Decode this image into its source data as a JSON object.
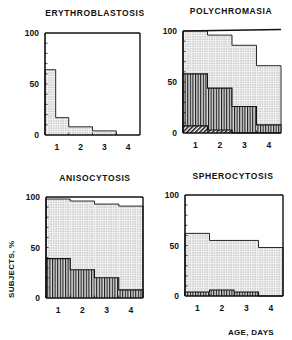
{
  "figure": {
    "ylabel": "SUBJECTS, %",
    "xlabel": "AGE, DAYS"
  },
  "colors": {
    "ink": "#111111",
    "dots": "#9a9a9a",
    "background": "#ffffff"
  },
  "chart_data": [
    {
      "type": "bar",
      "title": "ERYTHROBLASTOSIS",
      "xlabel": "",
      "ylabel": "",
      "categories": [
        "1",
        "2",
        "3",
        "4"
      ],
      "yticks": [
        "0",
        "50",
        "100"
      ],
      "ylim": [
        0,
        100
      ],
      "bar_edges": [
        0,
        0.45,
        1.0,
        2.0,
        3.0
      ],
      "series": [
        {
          "name": "dotted",
          "pattern": "dots",
          "values": [
            64,
            17,
            8,
            4
          ]
        }
      ],
      "layout": {
        "x": 45,
        "y": 33,
        "w": 95,
        "h": 102,
        "tickx": 9,
        "titlex": 95,
        "titley": 16,
        "boxed": true
      }
    },
    {
      "type": "bar",
      "title": "POLYCHROMASIA",
      "xlabel": "",
      "ylabel": "",
      "categories": [
        "1",
        "2",
        "3",
        "4"
      ],
      "yticks": [
        "0",
        "50",
        "100"
      ],
      "ylim": [
        0,
        100
      ],
      "series": [
        {
          "name": "dotted",
          "pattern": "dots",
          "values": [
            100,
            96,
            86,
            66
          ]
        },
        {
          "name": "vertical-striped",
          "pattern": "vlines",
          "values": [
            58,
            44,
            26,
            8
          ]
        },
        {
          "name": "diagonal-hatched",
          "pattern": "diag",
          "values": [
            7,
            3,
            0,
            0
          ]
        }
      ],
      "layout": {
        "x": 183,
        "y": 31,
        "w": 98,
        "h": 102,
        "tickx": 150,
        "titlex": 231,
        "titley": 14,
        "boxed": false
      }
    },
    {
      "type": "bar",
      "title": "ANISOCYTOSIS",
      "xlabel": "",
      "ylabel": "SUBJECTS, %",
      "categories": [
        "1",
        "2",
        "3",
        "4"
      ],
      "yticks": [
        "0",
        "50",
        "100"
      ],
      "ylim": [
        0,
        100
      ],
      "series": [
        {
          "name": "dotted",
          "pattern": "dots",
          "values": [
            98,
            96,
            93,
            91
          ]
        },
        {
          "name": "vertical-striped",
          "pattern": "vlines",
          "values": [
            39,
            28,
            20,
            8
          ]
        }
      ],
      "layout": {
        "x": 46,
        "y": 197,
        "w": 97,
        "h": 101,
        "tickx": 26,
        "titlex": 95,
        "titley": 181,
        "boxed": true
      }
    },
    {
      "type": "bar",
      "title": "SPHEROCYTOSIS",
      "xlabel": "AGE, DAYS",
      "ylabel": "",
      "categories": [
        "1",
        "2",
        "3",
        "4"
      ],
      "yticks": [
        "0",
        "50",
        "100"
      ],
      "ylim": [
        0,
        100
      ],
      "series": [
        {
          "name": "dotted",
          "pattern": "dots",
          "values": [
            62,
            55,
            55,
            48
          ]
        },
        {
          "name": "vertical-striped",
          "pattern": "vlines",
          "values": [
            4,
            6,
            4,
            0
          ]
        }
      ],
      "layout": {
        "x": 185,
        "y": 195,
        "w": 98,
        "h": 101,
        "tickx": 160,
        "titlex": 233,
        "titley": 179,
        "boxed": true
      }
    }
  ]
}
